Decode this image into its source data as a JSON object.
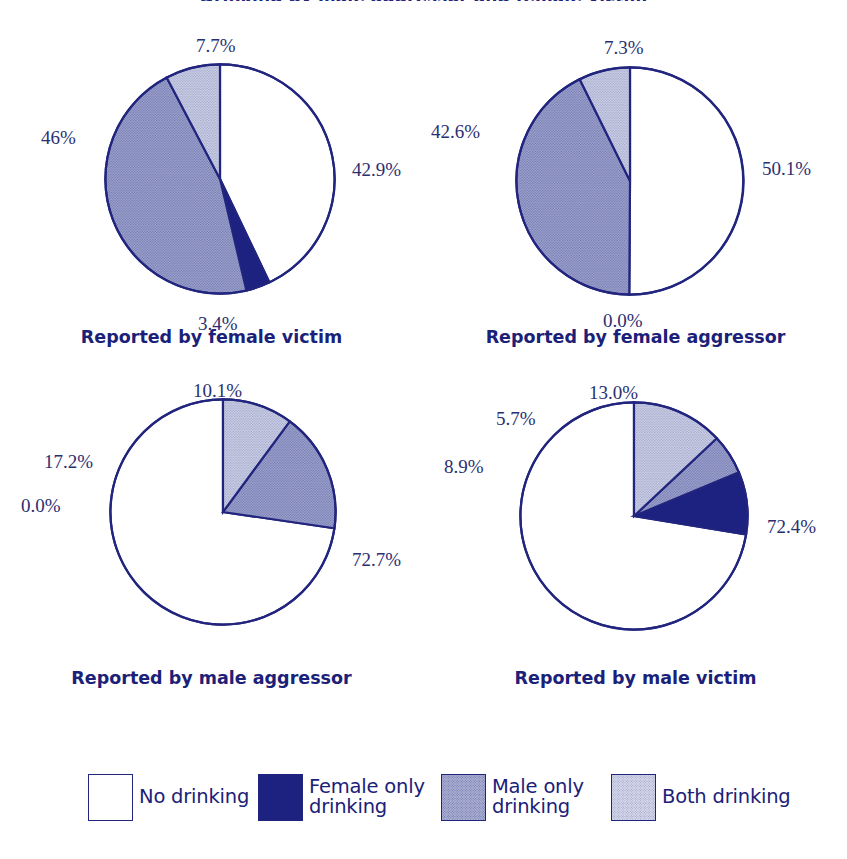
{
  "figure": {
    "title": "Drinking by male aggressor and female victim",
    "palette": {
      "outline": "#21257e",
      "no_drinking": "#ffffff",
      "female_only": "#1d2180",
      "male_only": "#8186bd",
      "both": "#b9bdd9",
      "label_text": "#2b2f72",
      "caption_text": "#1b2178"
    }
  },
  "chart_data": [
    {
      "type": "pie",
      "id": "female-victim",
      "title": "Reported by female victim",
      "categories": [
        "No drinking",
        "Female only drinking",
        "Male only drinking",
        "Both drinking"
      ],
      "values": [
        42.9,
        3.4,
        46.0,
        7.7
      ],
      "labels": [
        "42.9%",
        "3.4%",
        "46%",
        "7.7%"
      ],
      "colors": [
        "#ffffff",
        "#1d2180",
        "#8186bd",
        "#b9bdd9"
      ],
      "start_angle": 0,
      "direction": "clockwise",
      "units": "percent"
    },
    {
      "type": "pie",
      "id": "female-aggressor",
      "title": "Reported by female aggressor",
      "categories": [
        "No drinking",
        "Female only drinking",
        "Male only drinking",
        "Both drinking"
      ],
      "values": [
        50.1,
        0.0,
        42.6,
        7.3
      ],
      "labels": [
        "50.1%",
        "0.0%",
        "42.6%",
        "7.3%"
      ],
      "colors": [
        "#ffffff",
        "#1d2180",
        "#8186bd",
        "#b9bdd9"
      ],
      "start_angle": 0,
      "direction": "clockwise",
      "units": "percent"
    },
    {
      "type": "pie",
      "id": "male-aggressor",
      "title": "Reported by male aggressor",
      "categories": [
        "No drinking",
        "Female only drinking",
        "Male only drinking",
        "Both drinking"
      ],
      "values": [
        72.7,
        0.0,
        17.2,
        10.1
      ],
      "labels": [
        "72.7%",
        "0.0%",
        "17.2%",
        "10.1%"
      ],
      "colors": [
        "#ffffff",
        "#1d2180",
        "#8186bd",
        "#b9bdd9"
      ],
      "start_angle": 0,
      "direction": "counterclockwise",
      "units": "percent"
    },
    {
      "type": "pie",
      "id": "male-victim",
      "title": "Reported by male victim",
      "categories": [
        "No drinking",
        "Female only drinking",
        "Male only drinking",
        "Both drinking"
      ],
      "values": [
        72.4,
        8.9,
        5.7,
        13.0
      ],
      "labels": [
        "72.4%",
        "8.9%",
        "5.7%",
        "13.0%"
      ],
      "colors": [
        "#ffffff",
        "#1d2180",
        "#8186bd",
        "#b9bdd9"
      ],
      "start_angle": 0,
      "direction": "counterclockwise",
      "units": "percent"
    }
  ],
  "legend": {
    "position": "bottom",
    "items": [
      {
        "label": "No drinking",
        "color": "#ffffff",
        "swatch": "legend-swatch-no-drinking"
      },
      {
        "label": "Female only\ndrinking",
        "color": "#1d2180",
        "swatch": "legend-swatch-female-only"
      },
      {
        "label": "Male only\ndrinking",
        "color": "#8186bd",
        "swatch": "legend-swatch-male-only"
      },
      {
        "label": "Both drinking",
        "color": "#b9bdd9",
        "swatch": "legend-swatch-both"
      }
    ]
  }
}
